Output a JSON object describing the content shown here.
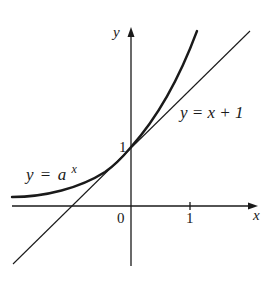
{
  "figure": {
    "axes": {
      "x_label": "x",
      "y_label": "y",
      "origin_label": "0",
      "x_tick_label": "1",
      "y_tick_label": "1"
    },
    "curves": [
      {
        "name": "exponential",
        "label_y": "y",
        "label_eq": "=",
        "label_base": "a",
        "label_exp": "x"
      },
      {
        "name": "tangent-line",
        "label": "y = x + 1"
      }
    ],
    "colors": {
      "ink": "#1a1a1a",
      "background": "#ffffff"
    }
  }
}
